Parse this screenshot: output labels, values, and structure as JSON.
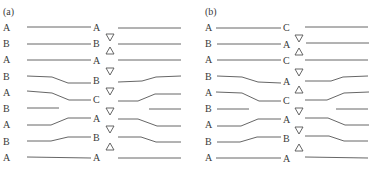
{
  "panels": [
    {
      "label": "(a)",
      "left_labels": [
        "A",
        "B",
        "A",
        "B",
        "A",
        "B",
        "A",
        "B",
        "A"
      ],
      "middle_labels": [
        "A",
        "B",
        "A",
        "B",
        "C",
        "A",
        "B",
        "A"
      ],
      "markers": [
        "down",
        "up",
        "down",
        "down",
        "down",
        "down",
        "up"
      ]
    },
    {
      "label": "(b)",
      "left_labels": [
        "A",
        "B",
        "A",
        "B",
        "A",
        "B",
        "A",
        "B",
        "A"
      ],
      "middle_labels": [
        "C",
        "A",
        "C",
        "A",
        "C",
        "A",
        "B",
        "A"
      ],
      "markers": [
        "down",
        "up",
        "down",
        "up",
        "down",
        "down",
        "up"
      ]
    }
  ],
  "marker_legend": {
    "down": "▽",
    "up": "△"
  }
}
